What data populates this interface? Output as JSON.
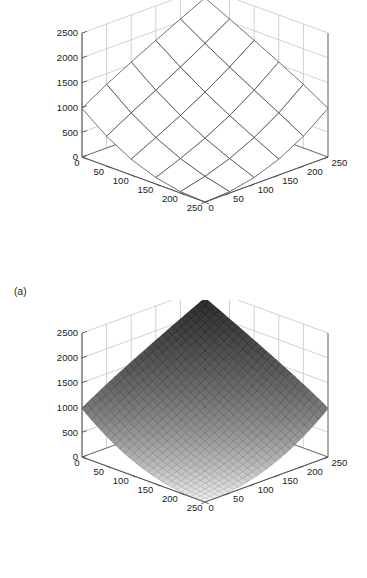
{
  "figure": {
    "type": "two-panel-3d-surface-figure",
    "background": "#ffffff",
    "panels": [
      {
        "id": "a",
        "caption": "(a)",
        "render": "coarse wireframe surface, white faces with dark gray edges"
      },
      {
        "id": "b",
        "caption": "(b)",
        "render": "fine mesh surface, grayscale shaded by height (light at low z, dark at high z)"
      }
    ]
  },
  "chart_data": [
    {
      "type": "surface",
      "panel": "a",
      "title": "",
      "xlabel": "",
      "ylabel": "",
      "zlabel": "",
      "xlim": [
        0,
        250
      ],
      "ylim": [
        0,
        250
      ],
      "zlim": [
        0,
        2500
      ],
      "xticks": [
        0,
        50,
        100,
        150,
        200,
        250
      ],
      "yticks": [
        0,
        50,
        100,
        150,
        200,
        250
      ],
      "zticks": [
        0,
        500,
        1000,
        1500,
        2000,
        2500
      ],
      "xticklabels": [
        "0",
        "50",
        "100",
        "150",
        "200",
        "250"
      ],
      "yticklabels": [
        "0",
        "50",
        "100",
        "150",
        "200",
        "250"
      ],
      "zticklabels": [
        "0",
        "500",
        "1000",
        "1500",
        "2000",
        "2500"
      ],
      "grid": true,
      "legend": null,
      "mesh_nx": 5,
      "mesh_ny": 5,
      "view": {
        "azimuth": -37.5,
        "elevation": 30
      },
      "surface_color": "#ffffff",
      "edge_color": "#444444",
      "grid_color": "#bdbdbd",
      "axis_color": "#555555",
      "z_values": [
        [
          0,
          0,
          0,
          0,
          0,
          0
        ],
        [
          0,
          30,
          90,
          160,
          240,
          330
        ],
        [
          0,
          90,
          250,
          430,
          640,
          860
        ],
        [
          0,
          160,
          430,
          760,
          1100,
          1470
        ],
        [
          0,
          240,
          640,
          1100,
          1640,
          2150
        ],
        [
          0,
          330,
          860,
          1470,
          2150,
          2500
        ]
      ]
    },
    {
      "type": "surface",
      "panel": "b",
      "title": "",
      "xlabel": "",
      "ylabel": "",
      "zlabel": "",
      "xlim": [
        0,
        250
      ],
      "ylim": [
        0,
        250
      ],
      "zlim": [
        0,
        2500
      ],
      "xticks": [
        0,
        50,
        100,
        150,
        200,
        250
      ],
      "yticks": [
        0,
        50,
        100,
        150,
        200,
        250
      ],
      "zticks": [
        0,
        500,
        1000,
        1500,
        2000,
        2500
      ],
      "xticklabels": [
        "0",
        "50",
        "100",
        "150",
        "200",
        "250"
      ],
      "yticklabels": [
        "0",
        "50",
        "100",
        "150",
        "200",
        "250"
      ],
      "zticklabels": [
        "0",
        "500",
        "1000",
        "1500",
        "2000",
        "2500"
      ],
      "grid": true,
      "legend": null,
      "mesh_nx": 26,
      "mesh_ny": 26,
      "view": {
        "azimuth": -37.5,
        "elevation": 30
      },
      "surface_color": "grayscale-height-shaded",
      "edge_color": "#303030",
      "grid_color": "#bdbdbd",
      "axis_color": "#555555",
      "shading": {
        "low": "#f2f2f2",
        "high": "#222222"
      },
      "z_values": [
        [
          0,
          0,
          0,
          0,
          0,
          0
        ],
        [
          0,
          30,
          90,
          160,
          240,
          330
        ],
        [
          0,
          90,
          250,
          430,
          640,
          860
        ],
        [
          0,
          160,
          430,
          760,
          1100,
          1470
        ],
        [
          0,
          240,
          640,
          1100,
          1640,
          2150
        ],
        [
          0,
          330,
          860,
          1470,
          2150,
          2500
        ]
      ]
    }
  ]
}
